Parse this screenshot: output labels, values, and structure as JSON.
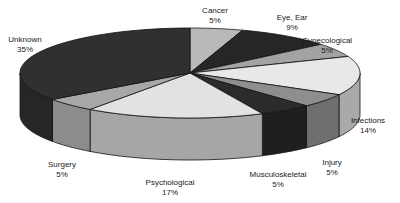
{
  "chart_data": {
    "type": "pie",
    "style": "3d",
    "title": "",
    "categories": [
      "Cancer",
      "Eye, Ear",
      "Gynecological",
      "Infections",
      "Injury",
      "Musculoskeletal",
      "Psychological",
      "Surgery",
      "Unknown"
    ],
    "values": [
      5,
      9,
      5,
      14,
      5,
      5,
      17,
      5,
      35
    ],
    "value_labels": [
      "5%",
      "9%",
      "5%",
      "14%",
      "5%",
      "5%",
      "17%",
      "5%",
      "35%"
    ],
    "start_angle": "12 o'clock",
    "direction": "clockwise",
    "legend": "none (labels placed around slices)",
    "colors_top": [
      "#b9b9b9",
      "#262626",
      "#a3a3a3",
      "#e8e8e8",
      "#8e8e8e",
      "#2b2b2b",
      "#e2e2e2",
      "#a8a8a8",
      "#303030"
    ],
    "colors_side": [
      "#9a9a9a",
      "#1c1c1c",
      "#8a8a8a",
      "#a9a9a9",
      "#6f6f6f",
      "#1f1f1f",
      "#a6a6a6",
      "#8c8c8c",
      "#262626"
    ],
    "label_positions": [
      {
        "x": 215,
        "y": 6
      },
      {
        "x": 292,
        "y": 13
      },
      {
        "x": 327,
        "y": 36
      },
      {
        "x": 368,
        "y": 116
      },
      {
        "x": 332,
        "y": 158
      },
      {
        "x": 278,
        "y": 170
      },
      {
        "x": 170,
        "y": 178
      },
      {
        "x": 62,
        "y": 160
      },
      {
        "x": 25,
        "y": 35
      }
    ]
  }
}
